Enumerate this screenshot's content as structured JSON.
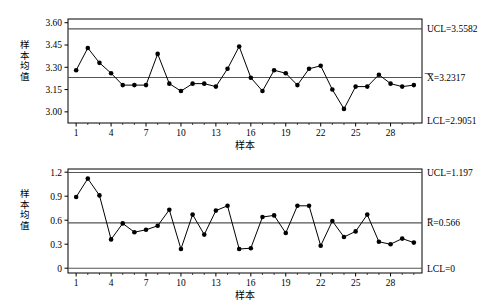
{
  "figure": {
    "charts": [
      {
        "id": "xbar-chart",
        "name": "x-bar-control-chart",
        "type": "line",
        "title": "",
        "xlabel": "样本",
        "ylabel": "样本均值",
        "ylabel_chars": [
          "样",
          "本",
          "均",
          "值"
        ],
        "yticks": [
          "3.60",
          "3.45",
          "3.30",
          "3.15",
          "3.00"
        ],
        "ytick_values": [
          3.6,
          3.45,
          3.3,
          3.15,
          3.0
        ],
        "xticks": [
          "1",
          "4",
          "7",
          "10",
          "13",
          "16",
          "19",
          "22",
          "25",
          "28"
        ],
        "xtick_values": [
          1,
          4,
          7,
          10,
          13,
          16,
          19,
          22,
          25,
          28
        ],
        "ylim": [
          2.925,
          3.625
        ],
        "xlim": [
          0.3,
          30.7
        ],
        "grid": false,
        "legend": "none",
        "limits": {
          "ucl_label": "UCL=3.5582",
          "center_label": "=\nI=3.2317",
          "center_label_symbol": "̅X̅",
          "center_label_text": "=3.2317",
          "lcl_label": "LCL=2.9051",
          "ucl": 3.5582,
          "center": 3.2317,
          "lcl": 2.9051
        },
        "x": [
          1,
          2,
          3,
          4,
          5,
          6,
          7,
          8,
          9,
          10,
          11,
          12,
          13,
          14,
          15,
          16,
          17,
          18,
          19,
          20,
          21,
          22,
          23,
          24,
          25,
          26,
          27,
          28,
          29,
          30
        ],
        "values": [
          3.28,
          3.43,
          3.33,
          3.26,
          3.18,
          3.18,
          3.18,
          3.39,
          3.19,
          3.14,
          3.19,
          3.19,
          3.17,
          3.29,
          3.44,
          3.23,
          3.14,
          3.28,
          3.26,
          3.18,
          3.29,
          3.31,
          3.15,
          3.02,
          3.17,
          3.17,
          3.25,
          3.19,
          3.17,
          3.18
        ]
      },
      {
        "id": "r-chart",
        "name": "range-control-chart",
        "type": "line",
        "title": "",
        "xlabel": "样本",
        "ylabel": "样本均值",
        "ylabel_chars": [
          "样",
          "本",
          "均",
          "值"
        ],
        "yticks": [
          "1.2",
          "0.9",
          "0.6",
          "0.3",
          "0"
        ],
        "ytick_values": [
          1.2,
          0.9,
          0.6,
          0.3,
          0
        ],
        "xticks": [
          "1",
          "4",
          "7",
          "10",
          "13",
          "16",
          "19",
          "22",
          "25",
          "28"
        ],
        "xtick_values": [
          1,
          4,
          7,
          10,
          13,
          16,
          19,
          22,
          25,
          28
        ],
        "ylim": [
          -0.06,
          1.24
        ],
        "xlim": [
          0.3,
          30.7
        ],
        "grid": false,
        "legend": "none",
        "limits": {
          "ucl_label": "UCL=1.197",
          "center_label": "R̅=0.566",
          "center_label_symbol": "R̅",
          "center_label_text": "=0.566",
          "lcl_label": "LCL=0",
          "ucl": 1.197,
          "center": 0.566,
          "lcl": 0
        },
        "x": [
          1,
          2,
          3,
          4,
          5,
          6,
          7,
          8,
          9,
          10,
          11,
          12,
          13,
          14,
          15,
          16,
          17,
          18,
          19,
          20,
          21,
          22,
          23,
          24,
          25,
          26,
          27,
          28,
          29,
          30
        ],
        "values": [
          0.89,
          1.12,
          0.91,
          0.36,
          0.56,
          0.45,
          0.48,
          0.53,
          0.73,
          0.24,
          0.67,
          0.42,
          0.72,
          0.78,
          0.24,
          0.25,
          0.64,
          0.66,
          0.44,
          0.78,
          0.78,
          0.28,
          0.59,
          0.39,
          0.46,
          0.67,
          0.33,
          0.3,
          0.37,
          0.32
        ]
      }
    ]
  },
  "chart_data": [
    {
      "type": "line",
      "title": "",
      "xlabel": "样本",
      "ylabel": "样本均值",
      "x": [
        1,
        2,
        3,
        4,
        5,
        6,
        7,
        8,
        9,
        10,
        11,
        12,
        13,
        14,
        15,
        16,
        17,
        18,
        19,
        20,
        21,
        22,
        23,
        24,
        25,
        26,
        27,
        28,
        29,
        30
      ],
      "values": [
        3.28,
        3.43,
        3.33,
        3.26,
        3.18,
        3.18,
        3.18,
        3.39,
        3.19,
        3.14,
        3.19,
        3.19,
        3.17,
        3.29,
        3.44,
        3.23,
        3.14,
        3.28,
        3.26,
        3.18,
        3.29,
        3.31,
        3.15,
        3.02,
        3.17,
        3.17,
        3.25,
        3.19,
        3.17,
        3.18
      ],
      "series": [
        {
          "name": "样本均值",
          "values": [
            3.28,
            3.43,
            3.33,
            3.26,
            3.18,
            3.18,
            3.18,
            3.39,
            3.19,
            3.14,
            3.19,
            3.19,
            3.17,
            3.29,
            3.44,
            3.23,
            3.14,
            3.28,
            3.26,
            3.18,
            3.29,
            3.31,
            3.15,
            3.02,
            3.17,
            3.17,
            3.25,
            3.19,
            3.17,
            3.18
          ]
        },
        {
          "name": "UCL=3.5582",
          "constant": 3.5582
        },
        {
          "name": "=X=3.2317",
          "constant": 3.2317
        },
        {
          "name": "LCL=2.9051",
          "constant": 2.9051
        }
      ],
      "xticklabels": [
        "1",
        "4",
        "7",
        "10",
        "13",
        "16",
        "19",
        "22",
        "25",
        "28"
      ],
      "yticklabels": [
        "3.60",
        "3.45",
        "3.30",
        "3.15",
        "3.00"
      ],
      "ylim": [
        2.925,
        3.625
      ],
      "xlim": [
        0.3,
        30.7
      ],
      "grid": false,
      "legend": "none"
    },
    {
      "type": "line",
      "title": "",
      "xlabel": "样本",
      "ylabel": "样本均值",
      "x": [
        1,
        2,
        3,
        4,
        5,
        6,
        7,
        8,
        9,
        10,
        11,
        12,
        13,
        14,
        15,
        16,
        17,
        18,
        19,
        20,
        21,
        22,
        23,
        24,
        25,
        26,
        27,
        28,
        29,
        30
      ],
      "values": [
        0.89,
        1.12,
        0.91,
        0.36,
        0.56,
        0.45,
        0.48,
        0.53,
        0.73,
        0.24,
        0.67,
        0.42,
        0.72,
        0.78,
        0.24,
        0.25,
        0.64,
        0.66,
        0.44,
        0.78,
        0.78,
        0.28,
        0.59,
        0.39,
        0.46,
        0.67,
        0.33,
        0.3,
        0.37,
        0.32
      ],
      "series": [
        {
          "name": "样本均值",
          "values": [
            0.89,
            1.12,
            0.91,
            0.36,
            0.56,
            0.45,
            0.48,
            0.53,
            0.73,
            0.24,
            0.67,
            0.42,
            0.72,
            0.78,
            0.24,
            0.25,
            0.64,
            0.66,
            0.44,
            0.78,
            0.78,
            0.28,
            0.59,
            0.39,
            0.46,
            0.67,
            0.33,
            0.3,
            0.37,
            0.32
          ]
        },
        {
          "name": "UCL=1.197",
          "constant": 1.197
        },
        {
          "name": "R=0.566",
          "constant": 0.566
        },
        {
          "name": "LCL=0",
          "constant": 0
        }
      ],
      "xticklabels": [
        "1",
        "4",
        "7",
        "10",
        "13",
        "16",
        "19",
        "22",
        "25",
        "28"
      ],
      "yticklabels": [
        "1.2",
        "0.9",
        "0.6",
        "0.3",
        "0"
      ],
      "ylim": [
        -0.06,
        1.24
      ],
      "xlim": [
        0.3,
        30.7
      ],
      "grid": false,
      "legend": "none"
    }
  ],
  "style": {
    "line_color": "#000000",
    "marker_color": "#000000",
    "limit_color": "#555555",
    "frame_color": "#000000",
    "background": "#ffffff"
  }
}
